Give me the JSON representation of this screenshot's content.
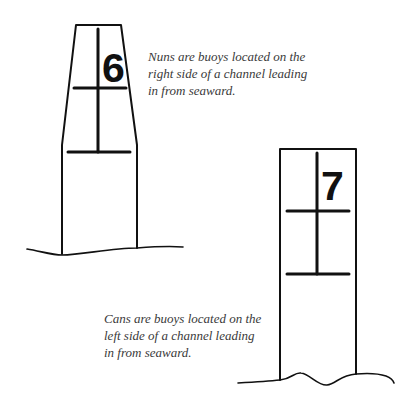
{
  "diagram": {
    "nun": {
      "name": "Nun buoy",
      "number": "6",
      "caption_lines": [
        "Nuns are buoys located on the",
        "right side of a channel leading",
        "in from seaward."
      ]
    },
    "can": {
      "name": "Can buoy",
      "number": "7",
      "caption_lines": [
        "Cans are buoys located on the",
        "left side of a channel leading",
        "in from seaward."
      ]
    },
    "colors": {
      "stroke": "#111111",
      "text": "#3a3a3a",
      "background": "#ffffff"
    }
  }
}
